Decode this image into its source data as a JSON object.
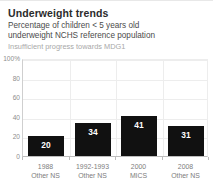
{
  "header": {
    "title": "Underweight trends",
    "subtitle_line1": "Percentage of children < 5 years old",
    "subtitle_line2": "underweight NCHS reference population",
    "note": "Insufficient progress towards MDG1"
  },
  "colors": {
    "bar": "#111111",
    "title_text": "#2b2b2b",
    "subtitle_text": "#4b4b4b",
    "note_text": "#a8a8a8",
    "axis_text": "#8d8d8d",
    "gridline": "#ededed",
    "axis_line": "#bdbdbd",
    "background": "#ffffff",
    "value_label": "#ffffff"
  },
  "chart_data": {
    "type": "bar",
    "title": "Underweight trends",
    "subtitle": "Percentage of children < 5 years old underweight NCHS reference population",
    "annotation": "Insufficient progress towards MDG1",
    "xlabel": "",
    "ylabel": "",
    "ylim": [
      0,
      100
    ],
    "grid": true,
    "legend": false,
    "y_ticks": [
      "100%",
      "80",
      "60",
      "40",
      "20",
      "0"
    ],
    "y_tick_values": [
      100,
      80,
      60,
      40,
      20,
      0
    ],
    "categories": [
      "1988",
      "1992-1993",
      "2000",
      "2008"
    ],
    "category_sources": [
      "Other NS",
      "Other NS",
      "MICS",
      "Other NS"
    ],
    "values": [
      20,
      34,
      41,
      31
    ],
    "data_labels": [
      "20",
      "34",
      "41",
      "31"
    ]
  }
}
